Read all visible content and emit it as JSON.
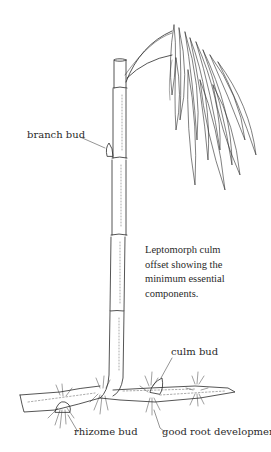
{
  "figure": {
    "caption_lines": [
      "Leptomorph culm",
      "offset showing the",
      "minimum essential",
      "components."
    ],
    "labels": {
      "branch_bud": "branch bud",
      "culm_bud": "culm bud",
      "rhizome_bud": "rhizome bud",
      "good_root_development": "good root development"
    },
    "colors": {
      "ink": "#2a2a2a",
      "background": "#ffffff"
    }
  }
}
